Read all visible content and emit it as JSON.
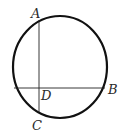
{
  "diagram": {
    "type": "geometry",
    "colors": {
      "stroke": "#111111",
      "label": "#2a2a2a",
      "background": "#ffffff"
    },
    "circle": {
      "cx": 60,
      "cy": 67,
      "rx": 47,
      "ry": 51
    },
    "chords": [
      {
        "name": "AC",
        "x1": 39,
        "y1": 20,
        "x2": 39,
        "y2": 112
      },
      {
        "name": "DB",
        "x1": 14,
        "y1": 88,
        "x2": 104,
        "y2": 88
      }
    ],
    "labels": {
      "A": "A",
      "B": "B",
      "C": "C",
      "D": "D"
    }
  }
}
